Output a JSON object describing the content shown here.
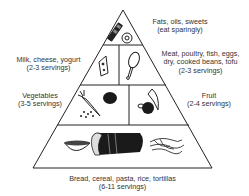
{
  "diagram": {
    "type": "food-pyramid",
    "colors": {
      "line": "#222222",
      "text": "#333333",
      "background": "#ffffff"
    },
    "groups": [
      {
        "id": "fats",
        "name": "Fats, oils, sweets",
        "servings": "(eat sparingly)",
        "tier": 1,
        "position": "top",
        "icons": [
          "candy-bar-icon",
          "donut-icon"
        ]
      },
      {
        "id": "milk",
        "name": "Milk, cheese, yogurt",
        "servings": "(2-3 servings)",
        "tier": 2,
        "position": "left",
        "icons": [
          "cheese-icon"
        ]
      },
      {
        "id": "meat",
        "name": "Meat, poultry, fish, eggs,",
        "name_line2": "dry, cooked beans, tofu",
        "servings": "(2-3 servings)",
        "tier": 2,
        "position": "right",
        "icons": [
          "drumstick-icon"
        ]
      },
      {
        "id": "vegetables",
        "name": "Vegetables",
        "servings": "(3-5 servings)",
        "tier": 3,
        "position": "left",
        "icons": [
          "carrot-icon",
          "tomato-icon",
          "peas-icon"
        ]
      },
      {
        "id": "fruit",
        "name": "Fruit",
        "servings": "(2-4 servings)",
        "tier": 3,
        "position": "right",
        "icons": [
          "banana-icon",
          "apple-icon"
        ]
      },
      {
        "id": "grains",
        "name": "Bread, cereal, pasta, rice, tortillas",
        "servings": "(6-11 servings)",
        "tier": 4,
        "position": "bottom",
        "icons": [
          "cereal-bowl-icon",
          "bread-loaf-icon",
          "pasta-icon"
        ]
      }
    ]
  }
}
